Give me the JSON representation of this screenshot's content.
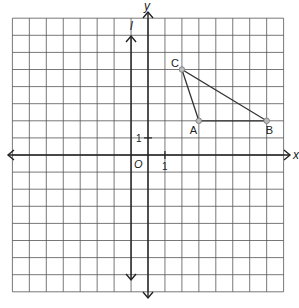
{
  "diagram": {
    "type": "coordinate-plane",
    "grid": {
      "x_min": -8,
      "x_max": 8,
      "y_min": -8,
      "y_max": 8,
      "cell_px": 17,
      "origin_px": [
        148,
        155
      ],
      "grid_color": "#555555",
      "axis_color": "#222222"
    },
    "axes": {
      "x_label": "x",
      "y_label": "y",
      "origin_label": "O",
      "x_tick_label": "1",
      "y_tick_label": "1"
    },
    "line_l": {
      "label": "l",
      "orientation": "vertical",
      "x": -1
    },
    "triangle": {
      "points": [
        {
          "label": "A",
          "x": 3,
          "y": 2
        },
        {
          "label": "B",
          "x": 7,
          "y": 2
        },
        {
          "label": "C",
          "x": 2,
          "y": 5
        }
      ],
      "edge_color": "#333333",
      "point_fill": "#bbbbbb"
    }
  }
}
